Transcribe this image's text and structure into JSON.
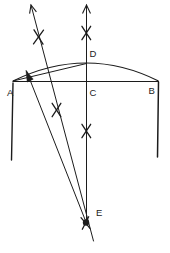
{
  "figure": {
    "background": "#ffffff",
    "ink": "#1c1c1c",
    "canvas": {
      "width": 170,
      "height": 253
    },
    "labels": [
      {
        "id": "A",
        "text": "A",
        "x": 7,
        "y": 96
      },
      {
        "id": "B",
        "text": "B",
        "x": 148.5,
        "y": 94
      },
      {
        "id": "C",
        "text": "C",
        "x": 89.5,
        "y": 96
      },
      {
        "id": "D",
        "text": "D",
        "x": 89.5,
        "y": 57
      },
      {
        "id": "E",
        "text": "E",
        "x": 96,
        "y": 216
      }
    ],
    "arc": {
      "name": "dome-arc",
      "d": "M 13 81 Q 86.5 45 158.5 81",
      "width": 1.2
    },
    "lines": [
      {
        "name": "horizon-line",
        "x1": 13,
        "y1": 81.5,
        "x2": 158.5,
        "y2": 81.5,
        "w": 1.2
      },
      {
        "name": "left-wall-line",
        "x1": 13,
        "y1": 83,
        "x2": 11.5,
        "y2": 160,
        "w": 1.4
      },
      {
        "name": "right-wall-line",
        "x1": 158.5,
        "y1": 82,
        "x2": 157.5,
        "y2": 157,
        "w": 1.5
      },
      {
        "name": "chord-a-d-line",
        "x1": 13,
        "y1": 81,
        "x2": 86.5,
        "y2": 63.5,
        "w": 1
      },
      {
        "name": "zenith-sight-line",
        "x1": 86.5,
        "y1": 5,
        "x2": 86.5,
        "y2": 222,
        "w": 1
      },
      {
        "name": "star-sight-line",
        "x1": 31,
        "y1": 5,
        "x2": 93.5,
        "y2": 241,
        "w": 1
      },
      {
        "name": "apparent-sight-line",
        "x1": 86,
        "y1": 222,
        "x2": 26.5,
        "y2": 71,
        "w": 1
      }
    ],
    "stars": [
      {
        "name": "star-mark-upper-left",
        "x": 38.5,
        "y": 37,
        "angles": [
          -36,
          32
        ],
        "len": 17
      },
      {
        "name": "star-mark-top-center",
        "x": 86.3,
        "y": 33,
        "angles": [
          -33,
          33
        ],
        "len": 16
      },
      {
        "name": "star-mark-mid-left",
        "x": 56.5,
        "y": 110,
        "angles": [
          -33,
          33
        ],
        "len": 16
      },
      {
        "name": "star-mark-mid-center",
        "x": 86.3,
        "y": 131,
        "angles": [
          -33,
          33
        ],
        "len": 16
      },
      {
        "name": "star-mark-eye",
        "x": 85.5,
        "y": 223,
        "angles": [
          -27,
          40
        ],
        "len": 14
      }
    ],
    "open_arrows": [
      {
        "name": "zenith-arrow-up",
        "points": "82.5,13.5 86.5,5 90.5,13.5"
      },
      {
        "name": "star-line-arrow-up",
        "points": "29.6,13.6 31,5 36.4,11.9"
      }
    ],
    "filled_arrow": {
      "name": "apparent-position-arrowhead",
      "points": "26,70.5 33.2,79.2 27.2,82"
    },
    "eye_dot": {
      "name": "eye-point-dot",
      "x": 86,
      "y": 222.5,
      "r": 3.2
    }
  }
}
